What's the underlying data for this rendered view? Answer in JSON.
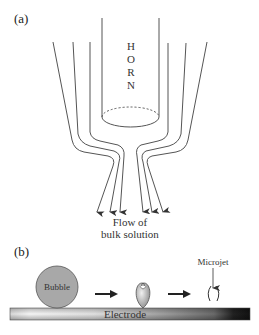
{
  "panel_a": {
    "label": "(a)",
    "horn_label": [
      "H",
      "O",
      "R",
      "N"
    ],
    "flow_caption_line1": "Flow of",
    "flow_caption_line2": "bulk solution"
  },
  "panel_b": {
    "label": "(b)",
    "bubble_label": "Bubble",
    "microjet_label": "Microjet",
    "electrode_label": "Electrode"
  },
  "colors": {
    "line": "#555555",
    "bubble_fill": "#a8a8a8",
    "electrode_light": "#f2f2f2",
    "electrode_dark": "#1a1a1a"
  }
}
